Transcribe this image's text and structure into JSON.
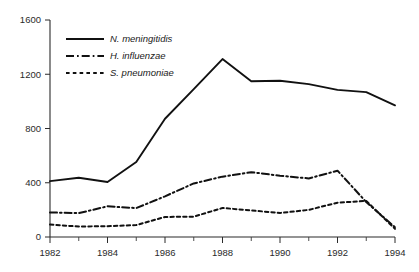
{
  "chart_data": {
    "type": "line",
    "title": "",
    "subtitle": "",
    "xlabel": "",
    "ylabel": "",
    "x": [
      1982,
      1983,
      1984,
      1985,
      1986,
      1987,
      1988,
      1989,
      1990,
      1991,
      1992,
      1993,
      1994
    ],
    "xlim": [
      1982,
      1994
    ],
    "ylim": [
      0,
      1600
    ],
    "xtick_labels": [
      "1982",
      "1984",
      "1986",
      "1988",
      "1990",
      "1992",
      "1994"
    ],
    "xtick_values": [
      1982,
      1984,
      1986,
      1988,
      1990,
      1992,
      1994
    ],
    "xtick_minor_values": [
      1983,
      1985,
      1987,
      1989,
      1991,
      1993
    ],
    "ytick_labels": [
      "0",
      "400",
      "800",
      "1200",
      "1600"
    ],
    "ytick_values": [
      0,
      400,
      800,
      1200,
      1600
    ],
    "grid": false,
    "legend_position": "upper-left-inside",
    "series": [
      {
        "name": "N. meningitidis",
        "style": "solid",
        "color": "#111111",
        "values": [
          412,
          437,
          406,
          553,
          872,
          1090,
          1312,
          1148,
          1152,
          1127,
          1085,
          1068,
          971
        ]
      },
      {
        "name": "H. influenzae",
        "style": "dash-dot",
        "color": "#111111",
        "values": [
          181,
          176,
          226,
          213,
          300,
          395,
          445,
          478,
          452,
          432,
          489,
          258,
          72
        ]
      },
      {
        "name": "S. pneumoniae",
        "style": "dotted",
        "color": "#111111",
        "values": [
          92,
          77,
          80,
          88,
          148,
          150,
          214,
          196,
          177,
          200,
          253,
          266,
          60
        ]
      }
    ]
  }
}
